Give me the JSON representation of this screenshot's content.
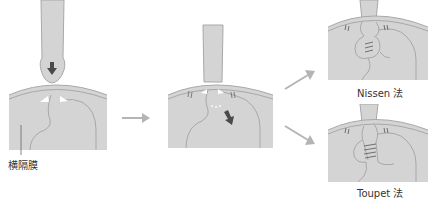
{
  "diagram": {
    "colors": {
      "tissue": "#d4d4d4",
      "outline": "#a8a8a8",
      "dark_arrow": "#4a4a4a",
      "flow_arrow": "#b4b4b4",
      "text": "#333333",
      "background": "#ffffff"
    },
    "panels": [
      {
        "id": "hernia",
        "description": "Stomach herniating upward through diaphragm; downward arrow indicates reduction"
      },
      {
        "id": "reduced",
        "description": "Stomach pulled back below diaphragm with hiatus sutured"
      },
      {
        "id": "nissen",
        "description": "Nissen fundoplication (360° wrap)"
      },
      {
        "id": "toupet",
        "description": "Toupet fundoplication (partial wrap)"
      }
    ],
    "labels": {
      "diaphragm": "横隔膜",
      "nissen": "Nissen 法",
      "toupet": "Toupet 法"
    },
    "flow": [
      {
        "from": "hernia",
        "to": "reduced"
      },
      {
        "from": "reduced",
        "to": "nissen"
      },
      {
        "from": "reduced",
        "to": "toupet"
      }
    ]
  }
}
